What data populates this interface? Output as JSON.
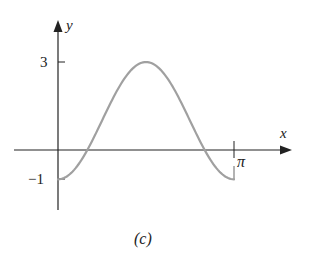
{
  "chart_data": {
    "type": "line",
    "title": "",
    "caption": "(c)",
    "xlabel": "x",
    "ylabel": "y",
    "function": "y = 1 - 2cos(2x)",
    "xlim": [
      0,
      3.14159
    ],
    "ylim": [
      -1,
      3
    ],
    "x_ticks": [
      {
        "value": 3.14159,
        "label": "π"
      }
    ],
    "y_ticks": [
      {
        "value": 3,
        "label": "3"
      },
      {
        "value": -1,
        "label": "−1"
      }
    ],
    "grid": false,
    "legend": null,
    "series": [
      {
        "name": "curve",
        "color": "#a0a0a0",
        "x": [
          0,
          0.5236,
          0.7854,
          1.0472,
          1.5708,
          2.0944,
          2.3562,
          2.618,
          3.14159
        ],
        "y": [
          -1,
          0,
          1,
          2,
          3,
          2,
          1,
          0,
          -1
        ]
      }
    ]
  },
  "labels": {
    "x_axis": "x",
    "y_axis": "y",
    "tick_y_top": "3",
    "tick_y_bottom": "−1",
    "tick_x_pi": "π",
    "caption": "(c)"
  }
}
